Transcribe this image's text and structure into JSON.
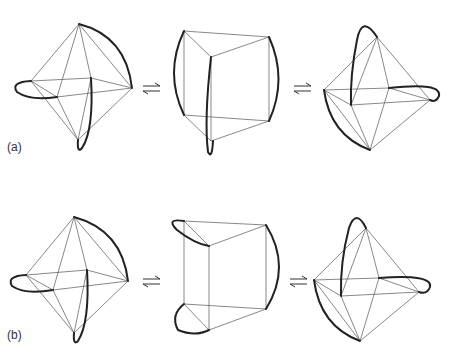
{
  "rows": [
    {
      "label": "(a)",
      "label_pos": [
        7,
        147
      ]
    },
    {
      "label": "(b)",
      "label_pos": [
        7,
        335
      ]
    }
  ],
  "arrow_symbol": "equilibrium-arrows"
}
